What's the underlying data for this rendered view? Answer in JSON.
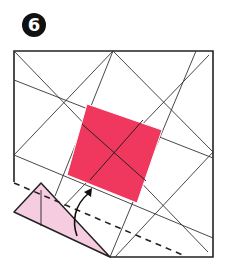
{
  "step": {
    "number": "6"
  },
  "colors": {
    "center_square": "#f0385e",
    "flap": "#f6cde0",
    "line": "#222222",
    "badge_bg": "#111111",
    "badge_text": "#ffffff"
  },
  "diagram": {
    "elements": [
      "crease-lines",
      "center-square",
      "folded-flap",
      "valley-fold-line",
      "fold-arrow"
    ]
  }
}
